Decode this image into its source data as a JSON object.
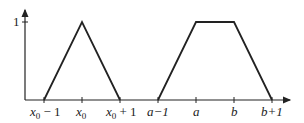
{
  "diagram": {
    "colors": {
      "line": "#222222",
      "background": "#ffffff"
    },
    "y_axis": {
      "tick_label": "1"
    },
    "x_axis": {
      "tick_labels": {
        "x0_minus_1": {
          "base": "x",
          "sub": "0",
          "suffix": " − 1"
        },
        "x0": {
          "base": "x",
          "sub": "0",
          "suffix": ""
        },
        "x0_plus_1": {
          "base": "x",
          "sub": "0",
          "suffix": " + 1"
        },
        "a_minus_1": "a−1",
        "a": "a",
        "b": "b",
        "b_plus_1": "b+1"
      }
    },
    "shapes": [
      {
        "type": "triangle",
        "points": [
          "x0-1",
          "x0",
          "x0+1"
        ],
        "peak": 1
      },
      {
        "type": "trapezoid",
        "points": [
          "a-1",
          "a",
          "b",
          "b+1"
        ],
        "plateau": 1
      }
    ]
  }
}
